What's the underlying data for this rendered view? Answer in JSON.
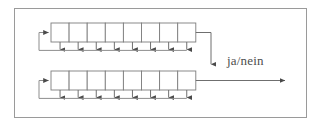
{
  "figure": {
    "name": "two-stage-shift-register-feedback-diagram",
    "border_color": "#9a9a9a",
    "line_color": "#6f6f6f",
    "cell_stroke_color": "#7d7d7d",
    "cell_fill_color": "#ffffff",
    "background_color": "#ffffff",
    "text_color": "#4d4d4d"
  },
  "labels": {
    "decision_output": "ja/nein"
  },
  "registers": [
    {
      "id": "upper-register",
      "cell_count": 8,
      "cells": [
        "",
        "",
        "",
        "",
        "",
        "",
        "",
        ""
      ],
      "tap_count": 8,
      "has_feedback_loop": true,
      "output_direction": "down"
    },
    {
      "id": "lower-register",
      "cell_count": 8,
      "cells": [
        "",
        "",
        "",
        "",
        "",
        "",
        "",
        ""
      ],
      "tap_count": 8,
      "has_feedback_loop": true,
      "output_direction": "right"
    }
  ],
  "geometry": {
    "frame": {
      "x": 14,
      "y": 8,
      "width": 293,
      "height": 110
    },
    "cell_width": 18.1,
    "cell_height": 19,
    "upper_row_top": 23,
    "lower_row_top": 71,
    "tape_left": 51,
    "tape_right": 196
  }
}
